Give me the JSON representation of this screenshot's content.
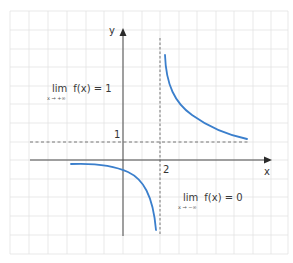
{
  "diagram": {
    "type": "function-graph",
    "axes": {
      "x_label": "x",
      "y_label": "y"
    },
    "ticks": {
      "y_tick": "1",
      "x_tick": "2"
    },
    "asymptotes": {
      "horizontal": {
        "y": 1,
        "style": "dashed"
      },
      "vertical": {
        "x": 2,
        "style": "dashed"
      }
    },
    "annotations": {
      "limit_plus_inf": {
        "word": "lim",
        "expr": "f(x) = 1",
        "subscript": "x → +∞"
      },
      "limit_minus_inf": {
        "word": "lim",
        "expr": "f(x) = 0",
        "subscript": "x → −∞"
      }
    },
    "colors": {
      "curve": "#3b7fcc",
      "grid": "#e2e2e2",
      "axis": "#444444",
      "dashed": "#666666"
    }
  }
}
